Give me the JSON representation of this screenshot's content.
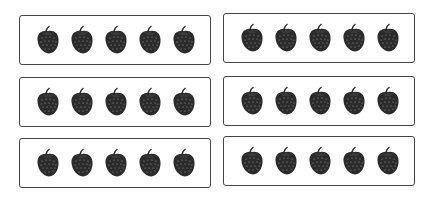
{
  "worksheet": {
    "boxes": [
      {
        "id": 1,
        "count": 5,
        "item": "strawberry",
        "x": 19,
        "y": 15
      },
      {
        "id": 2,
        "count": 5,
        "item": "strawberry",
        "x": 223,
        "y": 13
      },
      {
        "id": 3,
        "count": 5,
        "item": "strawberry",
        "x": 19,
        "y": 77
      },
      {
        "id": 4,
        "count": 5,
        "item": "strawberry",
        "x": 223,
        "y": 76
      },
      {
        "id": 5,
        "count": 5,
        "item": "strawberry",
        "x": 19,
        "y": 138
      },
      {
        "id": 6,
        "count": 5,
        "item": "strawberry",
        "x": 223,
        "y": 136
      }
    ],
    "icon": "strawberry-icon",
    "colors": {
      "fruit": "#2b2b2b",
      "seeds": "#9a9a9a",
      "border": "#444444",
      "background": "#ffffff"
    }
  }
}
